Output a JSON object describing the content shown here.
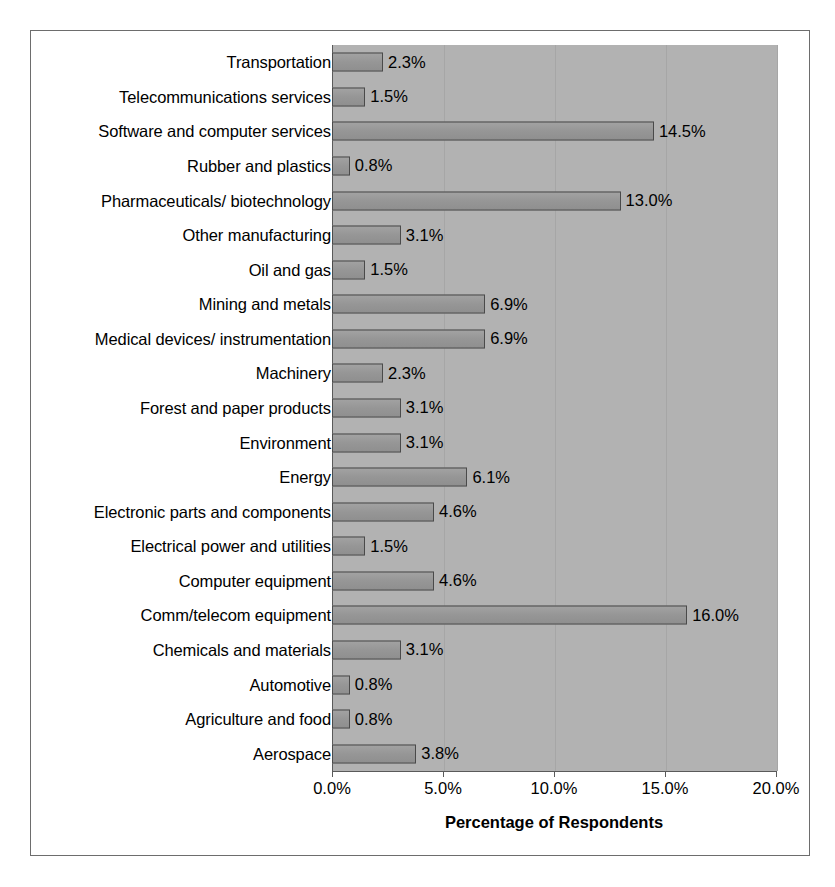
{
  "chart_data": {
    "type": "bar",
    "orientation": "horizontal",
    "title": "",
    "xlabel": "Percentage of Respondents",
    "ylabel": "",
    "xlim": [
      0,
      20
    ],
    "xticks": [
      "0.0%",
      "5.0%",
      "10.0%",
      "15.0%",
      "20.0%"
    ],
    "xtick_values": [
      0,
      5,
      10,
      15,
      20
    ],
    "grid": true,
    "legend": "none",
    "categories": [
      "Transportation",
      "Telecommunications services",
      "Software and computer services",
      "Rubber and plastics",
      "Pharmaceuticals/ biotechnology",
      "Other manufacturing",
      "Oil and gas",
      "Mining and metals",
      "Medical devices/ instrumentation",
      "Machinery",
      "Forest and paper products",
      "Environment",
      "Energy",
      "Electronic parts and components",
      "Electrical power and utilities",
      "Computer equipment",
      "Comm/telecom equipment",
      "Chemicals and materials",
      "Automotive",
      "Agriculture and food",
      "Aerospace"
    ],
    "values": [
      2.3,
      1.5,
      14.5,
      0.8,
      13.0,
      3.1,
      1.5,
      6.9,
      6.9,
      2.3,
      3.1,
      3.1,
      6.1,
      4.6,
      1.5,
      4.6,
      16.0,
      3.1,
      0.8,
      0.8,
      3.8
    ],
    "data_labels": [
      "2.3%",
      "1.5%",
      "14.5%",
      "0.8%",
      "13.0%",
      "3.1%",
      "1.5%",
      "6.9%",
      "6.9%",
      "2.3%",
      "3.1%",
      "3.1%",
      "6.1%",
      "4.6%",
      "1.5%",
      "4.6%",
      "16.0%",
      "3.1%",
      "0.8%",
      "0.8%",
      "3.8%"
    ],
    "colors": {
      "plot_background": "#b2b2b2",
      "bar_fill": "#9a9a9a",
      "bar_border": "#4a4a4a",
      "frame_border": "#6d6d6d",
      "axis_line": "#5a5a5a",
      "gridline": "#a6a6a6",
      "text": "#000000",
      "page_background": "#ffffff"
    }
  }
}
